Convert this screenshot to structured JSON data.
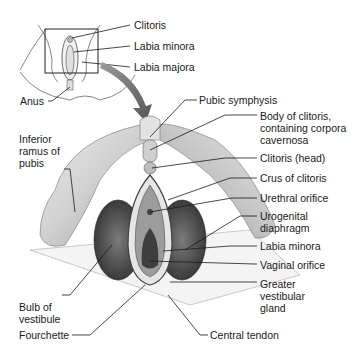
{
  "inset": {
    "labels": {
      "clitoris": "Clitoris",
      "labia_minora": "Labia minora",
      "labia_majora": "Labia majora",
      "anus": "Anus"
    }
  },
  "main": {
    "labels_left": {
      "inferior_ramus": "Inferior\nramus of\npubis",
      "bulb_of_vestibule": "Bulb of\nvestibule",
      "fourchette": "Fourchette"
    },
    "labels_right": {
      "pubic_symphysis": "Pubic symphysis",
      "body_of_clitoris": "Body of clitoris,\ncontaining corpora\ncavernosa",
      "clitoris_head": "Clitoris (head)",
      "crus_of_clitoris": "Crus of clitoris",
      "urethral_orifice": "Urethral orifice",
      "urogenital_diaphragm": "Urogenital\ndiaphragm",
      "labia_minora": "Labia minora",
      "vaginal_orifice": "Vaginal orifice",
      "greater_vestibular_gland": "Greater\nvestibular\ngland"
    },
    "labels_bottom": {
      "central_tendon": "Central tendon"
    }
  },
  "colors": {
    "line": "#1a1a1a",
    "bone": "#d6d6d6",
    "bone_shadow": "#a8a8a8",
    "tissue_dark": "#4a4a4a",
    "arrow": "#6e6e6e"
  }
}
